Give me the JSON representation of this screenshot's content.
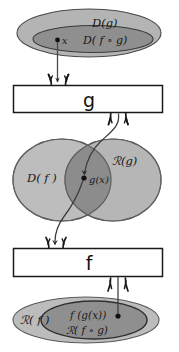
{
  "diagram": {
    "colors": {
      "outer_ellipse_fill": "#b4b4b4",
      "inner_ellipse_fill": "#8f8f8f",
      "left_ellipse_fill": "#bdbdbd",
      "right_ellipse_fill": "#b0b0b0",
      "intersection_fill": "#8c8c8c",
      "box_fill": "#ffffff",
      "stroke": "#1a1a1a",
      "line": "#3c3c3c",
      "background": "#ffffff"
    },
    "top_region": {
      "outer_label": "D(g)",
      "inner_label": "D( f ∘ g)",
      "point_label": "x",
      "point_dot": "point-x"
    },
    "g_box": {
      "label": "g"
    },
    "middle_region": {
      "left_label": "D( f )",
      "right_label": "ℛ(g)",
      "point_label": "g(x)",
      "point_dot": "point-gx"
    },
    "f_box": {
      "label": "f"
    },
    "bottom_region": {
      "outer_label": "ℛ( f )",
      "inner_label_top": "f (g(x))",
      "inner_label_bottom": "ℛ( f ∘ g)",
      "point_dot": "point-fgx"
    },
    "arrows": {
      "x_to_g": "arrow-x-into-g-box",
      "g_to_gx": "arrow-g-box-to-gx",
      "gx_to_f": "arrow-gx-into-f-box",
      "f_to_fgx": "arrow-f-box-to-fgx"
    }
  }
}
